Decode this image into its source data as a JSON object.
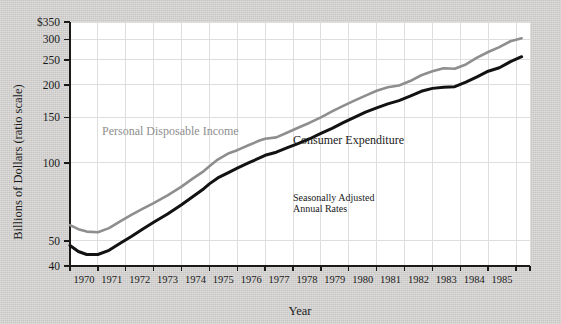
{
  "figure": {
    "background_color": "#d5d4d2",
    "plot_background_color": "#ffffff",
    "grid_color": "#dedede",
    "axis_color": "#1a1a1a"
  },
  "chart_data": {
    "type": "line",
    "title": "",
    "xlabel": "Year",
    "ylabel": "Billions of Dollars (ratio scale)",
    "scale": "log",
    "grid": true,
    "legend": "inline-labels",
    "xlim": [
      1969.0,
      1985.5
    ],
    "ylim": [
      40,
      350
    ],
    "ytick_values": [
      40,
      50,
      100,
      150,
      200,
      250,
      300,
      350
    ],
    "ytick_labels": [
      "40",
      "50",
      "100",
      "150",
      "200",
      "250",
      "300",
      "$350"
    ],
    "xtick_values": [
      1969.0,
      1970.0,
      1971.0,
      1972.0,
      1973.0,
      1974.0,
      1975.0,
      1976.0,
      1977.0,
      1978.0,
      1979.0,
      1980.0,
      1981.0,
      1982.0,
      1983.0,
      1984.0,
      1985.0,
      1985.5
    ],
    "xtick_labels": [
      "1970",
      "1971",
      "1972",
      "1973",
      "1974",
      "1975",
      "1976",
      "1977",
      "1978",
      "1979",
      "1980",
      "1981",
      "1982",
      "1983",
      "1984",
      "1985"
    ],
    "annotations": [
      {
        "name": "seasonal-note",
        "text_line1": "Seasonally Adjusted",
        "text_line2": "Annual Rates",
        "x": 1977.0,
        "y": 71
      }
    ],
    "series": [
      {
        "name": "Personal Disposable Income",
        "color": "#8e8e8e",
        "label_x": 1970.15,
        "label_y": 128,
        "x": [
          1969.0,
          1969.3,
          1969.6,
          1970.0,
          1970.4,
          1970.8,
          1971.2,
          1971.6,
          1972.0,
          1972.5,
          1973.0,
          1973.4,
          1973.8,
          1974.0,
          1974.3,
          1974.7,
          1975.0,
          1975.4,
          1975.8,
          1976.0,
          1976.4,
          1976.8,
          1977.2,
          1977.6,
          1978.0,
          1978.4,
          1978.8,
          1979.2,
          1979.6,
          1980.0,
          1980.4,
          1980.8,
          1981.2,
          1981.6,
          1982.0,
          1982.4,
          1982.8,
          1983.2,
          1983.6,
          1984.0,
          1984.4,
          1984.8,
          1985.2
        ],
        "values": [
          57.5,
          55.5,
          54.3,
          54.0,
          56.0,
          59.5,
          63.0,
          66.5,
          70.0,
          75.0,
          81.0,
          87.0,
          93.0,
          97.0,
          103.0,
          109.0,
          112.0,
          117.0,
          122.0,
          124.0,
          125.5,
          131.0,
          137.0,
          143.0,
          150.0,
          158.0,
          166.0,
          174.0,
          182.0,
          190.0,
          196.0,
          199.0,
          207.0,
          218.0,
          226.0,
          232.0,
          231.0,
          240.0,
          255.0,
          268.0,
          280.0,
          295.0,
          303.0
        ]
      },
      {
        "name": "Consumer Expenditure",
        "color": "#121212",
        "label_x": 1977.0,
        "label_y": 118,
        "x": [
          1969.0,
          1969.3,
          1969.6,
          1970.0,
          1970.4,
          1970.8,
          1971.2,
          1971.6,
          1972.0,
          1972.5,
          1973.0,
          1973.4,
          1973.8,
          1974.0,
          1974.3,
          1974.7,
          1975.0,
          1975.4,
          1975.8,
          1976.0,
          1976.4,
          1976.8,
          1977.2,
          1977.6,
          1978.0,
          1978.4,
          1978.8,
          1979.2,
          1979.6,
          1980.0,
          1980.4,
          1980.8,
          1981.2,
          1981.6,
          1982.0,
          1982.4,
          1982.8,
          1983.2,
          1983.6,
          1984.0,
          1984.4,
          1984.8,
          1985.2
        ],
        "values": [
          48.0,
          45.5,
          44.3,
          44.3,
          46.0,
          49.0,
          52.0,
          55.5,
          59.0,
          63.5,
          69.0,
          74.0,
          79.5,
          83.0,
          87.5,
          92.0,
          95.5,
          100.0,
          104.5,
          107.0,
          110.0,
          114.5,
          119.0,
          124.0,
          130.0,
          136.0,
          143.0,
          150.0,
          157.0,
          163.0,
          169.0,
          174.0,
          181.0,
          189.0,
          194.0,
          196.0,
          197.0,
          205.0,
          215.0,
          226.0,
          233.0,
          246.0,
          257.0
        ]
      }
    ]
  }
}
